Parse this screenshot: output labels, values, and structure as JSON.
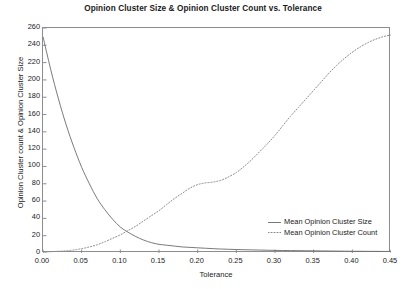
{
  "chart_data": {
    "type": "line",
    "title": "Opinion Cluster Size & Opinion Cluster Count vs. Tolerance",
    "xlabel": "Tolerance",
    "ylabel": "Opinion Cluster count & Opinion Cluster Size",
    "xlim": [
      0.0,
      0.45
    ],
    "ylim": [
      0,
      260
    ],
    "grid": false,
    "legend_position": "lower right",
    "xticks": [
      "0.00",
      "0.05",
      "0.10",
      "0.15",
      "0.20",
      "0.25",
      "0.30",
      "0.35",
      "0.40",
      "0.45"
    ],
    "xtick_values": [
      0.0,
      0.05,
      0.1,
      0.15,
      0.2,
      0.25,
      0.3,
      0.35,
      0.4,
      0.45
    ],
    "yticks": [
      "0",
      "20",
      "40",
      "60",
      "80",
      "100",
      "120",
      "140",
      "160",
      "180",
      "200",
      "220",
      "240",
      "260"
    ],
    "ytick_values": [
      0,
      20,
      40,
      60,
      80,
      100,
      120,
      140,
      160,
      180,
      200,
      220,
      240,
      260
    ],
    "x": [
      0.0,
      0.01,
      0.02,
      0.03,
      0.04,
      0.05,
      0.06,
      0.07,
      0.08,
      0.09,
      0.1,
      0.11,
      0.12,
      0.13,
      0.14,
      0.15,
      0.16,
      0.17,
      0.18,
      0.19,
      0.2,
      0.21,
      0.22,
      0.23,
      0.24,
      0.25,
      0.26,
      0.27,
      0.28,
      0.29,
      0.3,
      0.31,
      0.32,
      0.33,
      0.34,
      0.35,
      0.36,
      0.37,
      0.38,
      0.39,
      0.4,
      0.41,
      0.42,
      0.43,
      0.44,
      0.45
    ],
    "series": [
      {
        "name": "Mean Opinion Cluster Size",
        "style": "solid",
        "color": "#6b6b6b",
        "values": [
          250,
          212,
          178,
          148,
          122,
          99,
          80,
          63,
          50,
          39,
          30,
          24,
          19,
          15,
          12,
          10,
          9,
          8,
          7,
          6.5,
          6,
          5.5,
          5,
          4.6,
          4.3,
          4,
          3.8,
          3.6,
          3.4,
          3.2,
          3,
          2.9,
          2.8,
          2.7,
          2.6,
          2.5,
          2.4,
          2.3,
          2.2,
          2.1,
          2,
          2,
          1.9,
          1.9,
          1.8,
          1.8
        ]
      },
      {
        "name": "Mean Opinion Cluster Count",
        "style": "dotted",
        "color": "#8a8a8a",
        "values": [
          1,
          1.5,
          2,
          2.5,
          3.5,
          5,
          7,
          9.5,
          13,
          17,
          21,
          26,
          31,
          37,
          43,
          49,
          56,
          63,
          69,
          75,
          79,
          81,
          82,
          84,
          88,
          93,
          100,
          108,
          117,
          126,
          136,
          147,
          158,
          168,
          178,
          188,
          198,
          208,
          217,
          225,
          232,
          238,
          243,
          247,
          250,
          252
        ]
      }
    ]
  },
  "legend": {
    "entries": [
      {
        "label": "Mean Opinion Cluster Size"
      },
      {
        "label": "Mean Opinion Cluster Count"
      }
    ]
  }
}
